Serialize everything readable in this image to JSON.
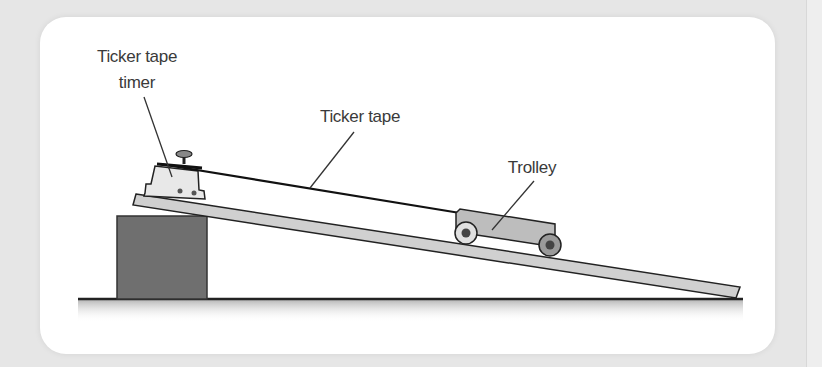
{
  "diagram": {
    "type": "physics-apparatus",
    "labels": {
      "timer_line1": "Ticker tape",
      "timer_line2": "timer",
      "tape": "Ticker tape",
      "trolley": "Trolley"
    },
    "colors": {
      "background": "#e6e6e6",
      "card": "#ffffff",
      "block": "#6f6f6f",
      "ramp": "#d0d0d0",
      "outline": "#222222",
      "trolley": "#bdbdbd",
      "label_text": "#3a3a3a"
    }
  }
}
